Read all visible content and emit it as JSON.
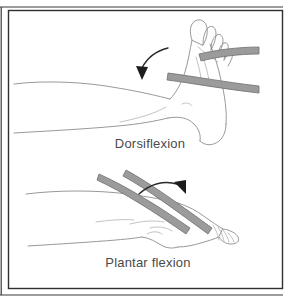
{
  "figure": {
    "background_color": "#ffffff",
    "frame_color": "#2f2f2f",
    "line_color": "#8d8d8d",
    "band_color": "#9b9b9b",
    "band_outline_color": "#6f6f6f",
    "arrow_color": "#1d1d1d",
    "caption_color": "#4a4a4a"
  },
  "panels": [
    {
      "id": "dorsiflexion",
      "caption": "Dorsiflexion",
      "caption_x": 150,
      "caption_y": 148,
      "arrow_direction": "counterclockwise-down-left",
      "band_count": 2,
      "foot_orientation": "toes-up"
    },
    {
      "id": "plantar-flexion",
      "caption": "Plantar flexion",
      "caption_x": 148,
      "caption_y": 267,
      "arrow_direction": "clockwise-down-right",
      "band_count": 2,
      "foot_orientation": "toes-pointed"
    }
  ]
}
